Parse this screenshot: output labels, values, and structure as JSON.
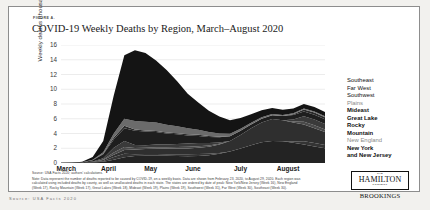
{
  "figure": {
    "label": "FIGURE A.",
    "title": "COVID-19 Weekly Deaths by Region, March–August 2020"
  },
  "source_line": "Source: USA Facts 2020; authors' calculations.",
  "note_text": "Note: Data represent the number of deaths reported to be caused by COVID-19, on a weekly basis. Data are shown from February 23, 2020, to August 29, 2020. Each region was calculated using included deaths by county, as well as unallocated deaths in each state. The states are ordered by date of peak: New York/New Jersey (Week 16), New England (Week 17), Rocky Mountain (Week 17), Great Lakes (Week 18), Mideast (Week 19), Plains (Week 19), Southwest (Week 31), Far West (Week 30), Southeast (Week 30).",
  "logo": {
    "the": "THE",
    "hamilton": "HAMILTON",
    "project": "PROJECT",
    "brookings": "BROOKINGS"
  },
  "outside_caption": "Source: USA Facts 2020",
  "chart_data": {
    "type": "area",
    "stacked": true,
    "title": "COVID-19 Weekly Deaths by Region, March–August 2020",
    "xlabel": "",
    "ylabel": "Weekly deaths (thousands)",
    "ylim": [
      0,
      16
    ],
    "yticks": [
      0,
      2,
      4,
      6,
      8,
      10,
      12,
      14,
      16
    ],
    "grid": true,
    "legend_position": "right",
    "xtick_labels": [
      "March",
      "April",
      "May",
      "June",
      "July",
      "August"
    ],
    "xtick_positions": [
      0.5,
      4.5,
      8.5,
      12.5,
      17.0,
      21.5
    ],
    "x": [
      0,
      1,
      2,
      3,
      4,
      5,
      6,
      7,
      8,
      9,
      10,
      11,
      12,
      13,
      14,
      15,
      16,
      17,
      18,
      19,
      20,
      21,
      22,
      23,
      24,
      25
    ],
    "series": [
      {
        "name": "New York and New Jersey",
        "color": "#141414",
        "values": [
          0.0,
          0.02,
          0.08,
          0.35,
          1.55,
          5.2,
          8.6,
          9.6,
          9.3,
          8.4,
          7.4,
          6.1,
          4.7,
          3.7,
          2.9,
          2.3,
          1.8,
          1.45,
          1.15,
          0.95,
          0.8,
          0.7,
          0.65,
          0.6,
          0.6,
          0.55
        ]
      },
      {
        "name": "New England",
        "color": "#6b6b6b",
        "values": [
          0.0,
          0.0,
          0.02,
          0.06,
          0.2,
          0.55,
          0.95,
          1.15,
          1.2,
          1.15,
          1.05,
          0.95,
          0.8,
          0.68,
          0.55,
          0.45,
          0.36,
          0.3,
          0.25,
          0.2,
          0.18,
          0.16,
          0.15,
          0.14,
          0.14,
          0.13
        ]
      },
      {
        "name": "Rocky Mountain",
        "color": "#2a2a2a"
      },
      {
        "name": "Great Lake",
        "color": "#1e1e1e",
        "values": [
          0.0,
          0.01,
          0.04,
          0.18,
          0.55,
          1.15,
          1.75,
          1.95,
          1.85,
          1.7,
          1.5,
          1.3,
          1.1,
          0.95,
          0.8,
          0.7,
          0.62,
          0.56,
          0.52,
          0.5,
          0.52,
          0.56,
          0.6,
          0.64,
          0.66,
          0.64
        ]
      },
      {
        "name": "Mideast",
        "color": "#3a3a3a"
      },
      {
        "name": "Plains",
        "color": "#4a4a4a"
      },
      {
        "name": "Southwest",
        "color": "#2f2f2f",
        "values": [
          0.0,
          0.0,
          0.01,
          0.04,
          0.12,
          0.3,
          0.5,
          0.62,
          0.68,
          0.72,
          0.75,
          0.78,
          0.8,
          0.85,
          0.95,
          1.15,
          1.45,
          1.85,
          2.3,
          2.7,
          2.95,
          2.85,
          2.6,
          2.3,
          2.0,
          1.75
        ]
      },
      {
        "name": "Far West",
        "color": "#343434"
      },
      {
        "name": "Southeast",
        "color": "#232323",
        "values": [
          0.0,
          0.0,
          0.01,
          0.05,
          0.18,
          0.45,
          0.78,
          0.95,
          1.0,
          1.0,
          0.98,
          0.95,
          0.92,
          0.95,
          1.05,
          1.25,
          1.55,
          1.95,
          2.4,
          2.8,
          3.0,
          2.95,
          2.75,
          2.5,
          2.25,
          2.0
        ]
      }
    ],
    "totals": [
      0.0,
      0.04,
      0.18,
      0.8,
      3.0,
      9.2,
      14.6,
      15.3,
      14.9,
      13.9,
      12.6,
      11.1,
      9.4,
      8.2,
      7.1,
      6.3,
      5.5,
      4.8,
      4.1,
      3.8,
      4.6,
      6.2,
      7.4,
      8.0,
      7.6,
      6.9
    ],
    "peak": {
      "value": 15.3,
      "label": "April"
    },
    "trough": {
      "value": 3.8,
      "label": "late June"
    },
    "summer_peak": {
      "value": 8.0,
      "label": "late July"
    }
  },
  "legend": {
    "items": [
      {
        "label": "Southeast",
        "weight": "normal"
      },
      {
        "label": "Far West",
        "weight": "normal"
      },
      {
        "label": "Southwest",
        "weight": "normal"
      },
      {
        "label": "Plains",
        "weight": "normal"
      },
      {
        "label": "Mideast",
        "weight": "bold"
      },
      {
        "label": "Great Lake",
        "weight": "bold"
      },
      {
        "label": "Rocky",
        "weight": "bold"
      },
      {
        "label": "Mountain",
        "weight": "bold"
      },
      {
        "label": "New England",
        "weight": "normal"
      },
      {
        "label": "New York",
        "weight": "bold"
      },
      {
        "label": "and New Jersey",
        "weight": "bold"
      }
    ]
  }
}
